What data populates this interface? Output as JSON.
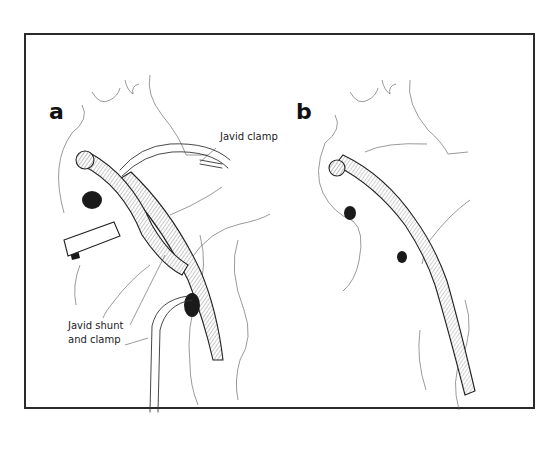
{
  "figure": {
    "type": "surgical illustration",
    "colors": {
      "ink": "#222222",
      "background": "#ffffff",
      "frame": "#2a2a2a"
    },
    "panels": [
      {
        "id": "a",
        "label": "a",
        "callouts": [
          {
            "id": "javid-clamp",
            "text": "Javid clamp"
          },
          {
            "id": "javid-shunt",
            "line1": "Javid shunt",
            "line2": "and clamp"
          }
        ]
      },
      {
        "id": "b",
        "label": "b",
        "callouts": []
      }
    ]
  }
}
